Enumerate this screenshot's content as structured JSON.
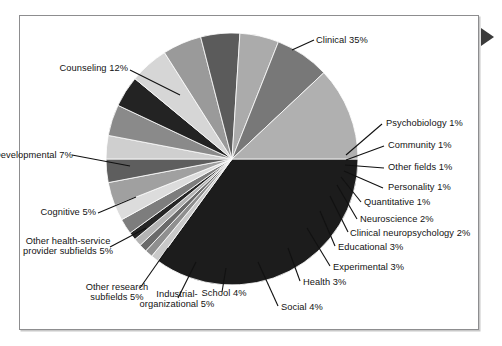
{
  "figure": {
    "background_color": "#ffffff",
    "frame_border_color": "#8d8d8f",
    "marker_icon": "right-triangle-marker"
  },
  "chart_data": {
    "type": "pie",
    "title": "",
    "subtitle": "",
    "xlabel": "",
    "ylabel": "",
    "legend_position": "none",
    "grid": false,
    "label_format": "{name} {value}%",
    "start_angle_deg": 0,
    "direction": "clockwise",
    "total": 100,
    "categories": [
      "Clinical",
      "Psychobiology",
      "Community",
      "Other fields",
      "Personality",
      "Quantitative",
      "Neuroscience",
      "Clinical neuropsychology",
      "Educational",
      "Experimental",
      "Health",
      "Social",
      "School",
      "Industrial-organizational",
      "Other research subfields",
      "Other health-service provider subfields",
      "Cognitive",
      "Developmental",
      "Counseling"
    ],
    "values": [
      35,
      1,
      1,
      1,
      1,
      1,
      2,
      2,
      3,
      3,
      3,
      4,
      4,
      5,
      5,
      5,
      5,
      7,
      12
    ],
    "colors": [
      "#1c1c1c",
      "#c9c9c9",
      "#8f8f8f",
      "#6a6a6a",
      "#b4b4b4",
      "#262626",
      "#7d7d7d",
      "#dcdcdc",
      "#a0a0a0",
      "#5e5e5e",
      "#cfcfcf",
      "#8a8a8a",
      "#232323",
      "#d6d6d6",
      "#9a9a9a",
      "#5b5b5b",
      "#ababab",
      "#787878",
      "#b0b0b0"
    ],
    "slices": [
      {
        "name": "Clinical",
        "value": 35,
        "label": "Clinical 35%"
      },
      {
        "name": "Psychobiology",
        "value": 1,
        "label": "Psychobiology 1%"
      },
      {
        "name": "Community",
        "value": 1,
        "label": "Community 1%"
      },
      {
        "name": "Other fields",
        "value": 1,
        "label": "Other fields 1%"
      },
      {
        "name": "Personality",
        "value": 1,
        "label": "Personality 1%"
      },
      {
        "name": "Quantitative",
        "value": 1,
        "label": "Quantitative 1%"
      },
      {
        "name": "Neuroscience",
        "value": 2,
        "label": "Neuroscience 2%"
      },
      {
        "name": "Clinical neuropsychology",
        "value": 2,
        "label": "Clinical neuropsychology 2%"
      },
      {
        "name": "Educational",
        "value": 3,
        "label": "Educational 3%"
      },
      {
        "name": "Experimental",
        "value": 3,
        "label": "Experimental 3%"
      },
      {
        "name": "Health",
        "value": 3,
        "label": "Health 3%"
      },
      {
        "name": "Social",
        "value": 4,
        "label": "Social 4%"
      },
      {
        "name": "School",
        "value": 4,
        "label": "School 4%"
      },
      {
        "name": "Industrial-organizational",
        "value": 5,
        "label": "Industrial-organizational 5%"
      },
      {
        "name": "Other research subfields",
        "value": 5,
        "label": "Other research subfields 5%"
      },
      {
        "name": "Other health-service provider subfields",
        "value": 5,
        "label": "Other health-service provider subfields 5%"
      },
      {
        "name": "Cognitive",
        "value": 5,
        "label": "Cognitive 5%"
      },
      {
        "name": "Developmental",
        "value": 7,
        "label": "Developmental 7%"
      },
      {
        "name": "Counseling",
        "value": 12,
        "label": "Counseling 12%"
      }
    ]
  },
  "labels": {
    "clinical": "Clinical 35%",
    "psychobiology": "Psychobiology 1%",
    "community": "Community 1%",
    "other_fields": "Other fields 1%",
    "personality": "Personality 1%",
    "quantitative": "Quantitative 1%",
    "neuroscience": "Neuroscience 2%",
    "clinical_neuropsychology": "Clinical neuropsychology 2%",
    "educational": "Educational 3%",
    "experimental": "Experimental 3%",
    "health": "Health 3%",
    "social": "Social 4%",
    "school": "School 4%",
    "industrial_organizational": "Industrial-organizational 5%",
    "other_research_subfields": "Other research subfields 5%",
    "other_health_service": "Other health-service provider subfields 5%",
    "cognitive": "Cognitive 5%",
    "developmental": "Developmental 7%",
    "counseling": "Counseling 12%"
  }
}
